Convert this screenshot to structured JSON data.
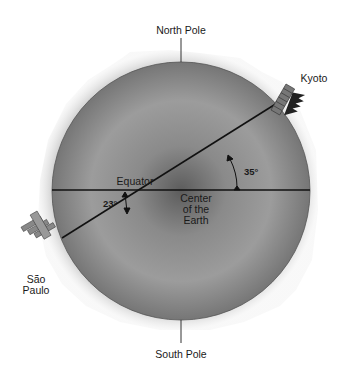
{
  "diagram": {
    "labels": {
      "north_pole": "North Pole",
      "south_pole": "South Pole",
      "equator": "Equator",
      "center_line1": "Center",
      "center_line2": "of the",
      "center_line3": "Earth",
      "kyoto": "Kyoto",
      "sao_paulo_line1": "São",
      "sao_paulo_line2": "Paulo",
      "angle_kyoto": "35°",
      "angle_sao_paulo": "23°"
    },
    "icons": {
      "kyoto": "pagoda-icon",
      "sao_paulo": "buildings-icon"
    },
    "colors": {
      "globe_dark": "#5a5a5a",
      "globe_light": "#9a9a9a",
      "terrain": "#8c8c8c",
      "line": "#111111",
      "text": "#1a1a1a"
    }
  }
}
